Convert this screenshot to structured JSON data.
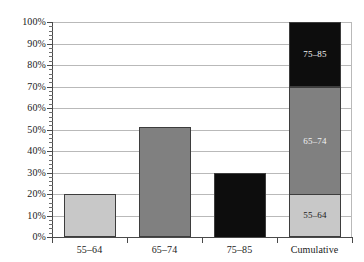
{
  "chart_data": {
    "type": "bar",
    "title": "",
    "subtitle": "",
    "xlabel": "",
    "ylabel": "",
    "categories": [
      "55–64",
      "65–74",
      "75–85",
      "Cumulative"
    ],
    "values": [
      20,
      51,
      30,
      100
    ],
    "ylim": [
      0,
      100
    ],
    "y_tick_step": 10,
    "y_minor_ticks": true,
    "grid": true,
    "grid_axis": "y",
    "legend": "none",
    "y_ticks": [
      {
        "value": 100,
        "label": "100%"
      },
      {
        "value": 90,
        "label": "90%"
      },
      {
        "value": 80,
        "label": "80%"
      },
      {
        "value": 70,
        "label": "70%"
      },
      {
        "value": 60,
        "label": "60%"
      },
      {
        "value": 50,
        "label": "50%"
      },
      {
        "value": 40,
        "label": "40%"
      },
      {
        "value": 30,
        "label": "30%"
      },
      {
        "value": 20,
        "label": "20%"
      },
      {
        "value": 10,
        "label": "10%"
      },
      {
        "value": 0,
        "label": "0%"
      }
    ],
    "bars": [
      {
        "category": "55–64",
        "value": 20,
        "color": "#c8c8c8",
        "border": "#3d3d3d",
        "stacked": false,
        "label": ""
      },
      {
        "category": "65–74",
        "value": 51,
        "color": "#808080",
        "border": "#3d3d3d",
        "stacked": false,
        "label": ""
      },
      {
        "category": "75–85",
        "value": 30,
        "color": "#0d0d0d",
        "border": "#3d3d3d",
        "stacked": false,
        "label": ""
      },
      {
        "category": "Cumulative",
        "value": 100,
        "stacked": true,
        "border": "#3d3d3d",
        "segments": [
          {
            "label": "55–64",
            "value": 20,
            "base": 0,
            "color": "#c8c8c8",
            "text_color": "#1a1a1a"
          },
          {
            "label": "65–74",
            "value": 50,
            "base": 20,
            "color": "#808080",
            "text_color": "#f2f2f2"
          },
          {
            "label": "75–85",
            "value": 30,
            "base": 70,
            "color": "#0d0d0d",
            "text_color": "#f2f2f2"
          }
        ]
      }
    ],
    "colors": {
      "light_gray": "#c8c8c8",
      "medium_gray": "#808080",
      "black": "#0d0d0d",
      "border": "#3d3d3d",
      "gridline": "#b9b9b9",
      "axis": "#4a4a4a",
      "background": "#ffffff",
      "text": "#1a1a1a"
    }
  }
}
